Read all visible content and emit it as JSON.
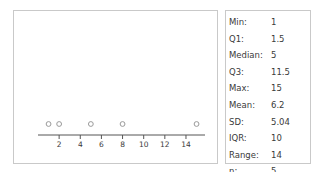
{
  "chart_data": {
    "type": "scatter",
    "title": "",
    "xlabel": "",
    "ylabel": "",
    "x": [
      1,
      2,
      5,
      8,
      15
    ],
    "y": [
      0,
      0,
      0,
      0,
      0
    ],
    "xlim": [
      0,
      15.8
    ],
    "xticks": [
      2,
      4,
      6,
      8,
      10,
      12,
      14
    ],
    "xtick_labels": [
      "2",
      "4",
      "6",
      "8",
      "10",
      "12",
      "14"
    ],
    "grid": false,
    "legend": null,
    "marker": "open-circle",
    "marker_color": "#9a9a9a",
    "axis_color": "#555555"
  },
  "plot": {
    "name": "dotplot"
  },
  "stats": {
    "rows": [
      {
        "label": "Min:",
        "value": "1"
      },
      {
        "label": "Q1:",
        "value": "1.5"
      },
      {
        "label": "Median:",
        "value": "5"
      },
      {
        "label": "Q3:",
        "value": "11.5"
      },
      {
        "label": "Max:",
        "value": "15"
      },
      {
        "label": "Mean:",
        "value": "6.2"
      },
      {
        "label": "SD:",
        "value": "5.04"
      },
      {
        "label": "IQR:",
        "value": "10"
      },
      {
        "label": "Range:",
        "value": "14"
      },
      {
        "label": "n:",
        "value": "5"
      }
    ]
  },
  "colors": {
    "panel_border": "#c9c9c9",
    "text": "#3a3a3a",
    "axis": "#555555",
    "marker": "#9a9a9a",
    "background": "#ffffff"
  }
}
